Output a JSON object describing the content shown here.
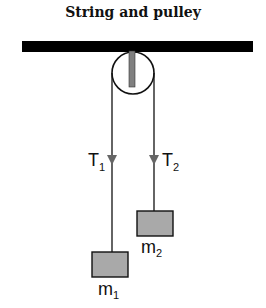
{
  "title": "String and pulley",
  "labels": {
    "tension_left": "T",
    "tension_left_sub": "1",
    "tension_right": "T",
    "tension_right_sub": "2",
    "mass_left": "m",
    "mass_left_sub": "1",
    "mass_right": "m",
    "mass_right_sub": "2"
  },
  "colors": {
    "ceiling": "#000000",
    "axle": "#808080",
    "arrow": "#666666",
    "mass_fill": "#a9a9a9",
    "stroke": "#111111"
  }
}
